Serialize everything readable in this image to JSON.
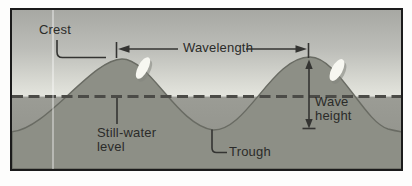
{
  "figure": {
    "type": "ocean-wave-anatomy-diagram",
    "labels": {
      "crest": "Crest",
      "wavelength": "Wavelength",
      "still_water": {
        "line1": "Still-water",
        "line2": "level"
      },
      "trough": "Trough",
      "wave_height": {
        "line1": "Wave",
        "line2": "height"
      }
    },
    "colors": {
      "frame_border": "#1b1b1b",
      "sky_top": "#a7a8a3",
      "sky_mid": "#bcbdb8",
      "sky_low": "#dadbd4",
      "sky_horizon": "#e4e5de",
      "water_top": "#9b9c95",
      "water_bottom": "#8e8f88",
      "wave_fill": "#8d8f86",
      "wave_outline": "#696b63",
      "dashed_line": "#4b4b47",
      "annotation": "#343432",
      "label_text": "#2b2b29",
      "foam": "#f7f7f1",
      "foam_shadow": "#83857d"
    }
  }
}
